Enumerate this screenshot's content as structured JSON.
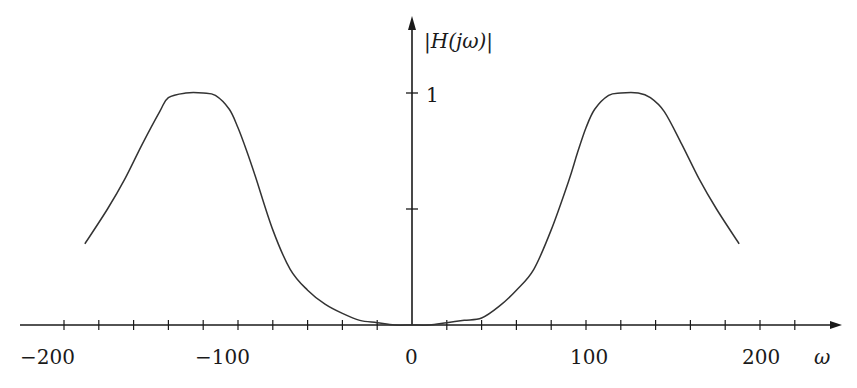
{
  "chart_data": {
    "type": "line",
    "title": "",
    "xlabel": "ω",
    "ylabel": "|H(jω)|",
    "xlim": [
      -235,
      245
    ],
    "ylim": [
      0,
      1.3
    ],
    "x_ticks_step": 20,
    "x_tick_labels": [
      "-200",
      "-100",
      "0",
      "100",
      "200"
    ],
    "y_ticks": [
      0.5,
      1
    ],
    "y_tick_labels": [
      "1"
    ],
    "grid": false,
    "legend": null,
    "series": [
      {
        "name": "|H(jω)|",
        "x": [
          -188,
          -175,
          -165,
          -155,
          -145,
          -140,
          -130,
          -120,
          -113,
          -105,
          -100,
          -95,
          -90,
          -80,
          -70,
          -60,
          -50,
          -40,
          -30,
          -20,
          -10,
          0,
          10,
          20,
          30,
          40,
          50,
          60,
          70,
          80,
          90,
          95,
          100,
          105,
          113,
          120,
          130,
          137,
          145,
          155,
          165,
          175,
          188
        ],
        "values": [
          0.35,
          0.5,
          0.63,
          0.78,
          0.92,
          0.98,
          1.0,
          1.0,
          0.99,
          0.93,
          0.85,
          0.75,
          0.64,
          0.41,
          0.24,
          0.15,
          0.09,
          0.05,
          0.02,
          0.01,
          0.0,
          0.0,
          0.0,
          0.01,
          0.02,
          0.03,
          0.08,
          0.15,
          0.24,
          0.41,
          0.62,
          0.74,
          0.85,
          0.93,
          0.99,
          1.0,
          1.0,
          0.98,
          0.92,
          0.78,
          0.63,
          0.5,
          0.35
        ]
      }
    ]
  },
  "labels": {
    "y_axis": "|H(jω)|",
    "y_one": "1",
    "x_axis": "ω",
    "x_m200": "−200",
    "x_m100": "−100",
    "x_0": "0",
    "x_100": "100",
    "x_200": "200"
  },
  "colors": {
    "axis": "#1a1a1a",
    "curve": "#333333"
  }
}
